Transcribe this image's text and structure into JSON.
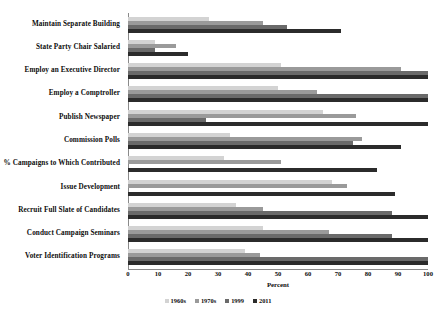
{
  "chart_data": {
    "type": "bar",
    "orientation": "horizontal",
    "title": "",
    "xlabel": "Percent",
    "ylabel": "",
    "xlim": [
      0,
      100
    ],
    "xticks": [
      0,
      10,
      20,
      30,
      40,
      50,
      60,
      70,
      80,
      90,
      100
    ],
    "grid": false,
    "legend_position": "bottom",
    "categories": [
      "Maintain Separate Building",
      "State Party Chair Salaried",
      "Employ an Executive Director",
      "Employ a Comptroller",
      "Publish Newspaper",
      "Commission Polls",
      "% Campaigns to Which Contributed",
      "Issue Development",
      "Recruit Full Slate of Candidates",
      "Conduct Campaign Seminars",
      "Voter Identification Programs"
    ],
    "series": [
      {
        "name": "1960s",
        "color": "#d3d3d3",
        "values": [
          27,
          9,
          51,
          50,
          65,
          34,
          32,
          68,
          36,
          45,
          39
        ]
      },
      {
        "name": "1970s",
        "color": "#9a9a9a",
        "values": [
          45,
          16,
          91,
          63,
          76,
          78,
          51,
          73,
          45,
          67,
          44
        ]
      },
      {
        "name": "1999",
        "color": "#6a6a6a",
        "values": [
          53,
          9,
          100,
          100,
          26,
          75,
          0,
          0,
          88,
          88,
          100
        ]
      },
      {
        "name": "2011",
        "color": "#2b2b2b",
        "values": [
          71,
          20,
          100,
          100,
          100,
          91,
          83,
          89,
          100,
          100,
          100
        ]
      }
    ]
  },
  "axis": {
    "x_title": "Percent"
  }
}
